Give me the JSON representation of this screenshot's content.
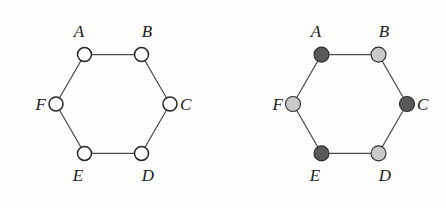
{
  "figure": {
    "background_color": "#fdfdfb",
    "edge_color": "#4a4a4a",
    "label_color": "#1a1a1a",
    "node_outline_color": "#262626",
    "dark_fill": "#595959",
    "light_fill": "#c9c9c9",
    "open_fill": "#ffffff"
  },
  "graphs": [
    {
      "id": "left-hexagon",
      "name": "uncolored-cycle-graph",
      "center": {
        "x": 113,
        "y": 104
      },
      "radius": 57,
      "node_radius": 7,
      "vertices": [
        {
          "label": "A",
          "x": 84.5,
          "y": 54.6,
          "fill": "#ffffff",
          "shade": "open",
          "label_pos": "above",
          "lx": 79,
          "ly": 33
        },
        {
          "label": "B",
          "x": 141.5,
          "y": 54.6,
          "fill": "#ffffff",
          "shade": "open",
          "label_pos": "above",
          "lx": 147,
          "ly": 33
        },
        {
          "label": "C",
          "x": 170,
          "y": 104,
          "fill": "#ffffff",
          "shade": "open",
          "label_pos": "right",
          "lx": 180,
          "ly": 106
        },
        {
          "label": "D",
          "x": 141.5,
          "y": 153.4,
          "fill": "#ffffff",
          "shade": "open",
          "label_pos": "below",
          "lx": 148,
          "ly": 177
        },
        {
          "label": "E",
          "x": 84.5,
          "y": 153.4,
          "fill": "#ffffff",
          "shade": "open",
          "label_pos": "below",
          "lx": 78,
          "ly": 177
        },
        {
          "label": "F",
          "x": 56,
          "y": 104,
          "fill": "#ffffff",
          "shade": "open",
          "label_pos": "left",
          "lx": 46,
          "ly": 106
        }
      ],
      "edges": [
        {
          "from": "A",
          "to": "B"
        },
        {
          "from": "B",
          "to": "C"
        },
        {
          "from": "C",
          "to": "D"
        },
        {
          "from": "D",
          "to": "E"
        },
        {
          "from": "E",
          "to": "F"
        },
        {
          "from": "F",
          "to": "A"
        }
      ]
    },
    {
      "id": "right-hexagon",
      "name": "two-colored-cycle-graph",
      "center": {
        "x": 350,
        "y": 104
      },
      "radius": 57,
      "node_radius": 7.5,
      "vertices": [
        {
          "label": "A",
          "x": 321.5,
          "y": 54.6,
          "fill": "#595959",
          "shade": "dark",
          "label_pos": "above",
          "lx": 316,
          "ly": 33
        },
        {
          "label": "B",
          "x": 378.5,
          "y": 54.6,
          "fill": "#c9c9c9",
          "shade": "light",
          "label_pos": "above",
          "lx": 384,
          "ly": 33
        },
        {
          "label": "C",
          "x": 407,
          "y": 104,
          "fill": "#595959",
          "shade": "dark",
          "label_pos": "right",
          "lx": 417,
          "ly": 106
        },
        {
          "label": "D",
          "x": 378.5,
          "y": 153.4,
          "fill": "#c9c9c9",
          "shade": "light",
          "label_pos": "below",
          "lx": 385,
          "ly": 177
        },
        {
          "label": "E",
          "x": 321.5,
          "y": 153.4,
          "fill": "#595959",
          "shade": "dark",
          "label_pos": "below",
          "lx": 315,
          "ly": 177
        },
        {
          "label": "F",
          "x": 293,
          "y": 104,
          "fill": "#c9c9c9",
          "shade": "light",
          "label_pos": "left",
          "lx": 283,
          "ly": 106
        }
      ],
      "edges": [
        {
          "from": "A",
          "to": "B"
        },
        {
          "from": "B",
          "to": "C"
        },
        {
          "from": "C",
          "to": "D"
        },
        {
          "from": "D",
          "to": "E"
        },
        {
          "from": "E",
          "to": "F"
        },
        {
          "from": "F",
          "to": "A"
        }
      ]
    }
  ]
}
